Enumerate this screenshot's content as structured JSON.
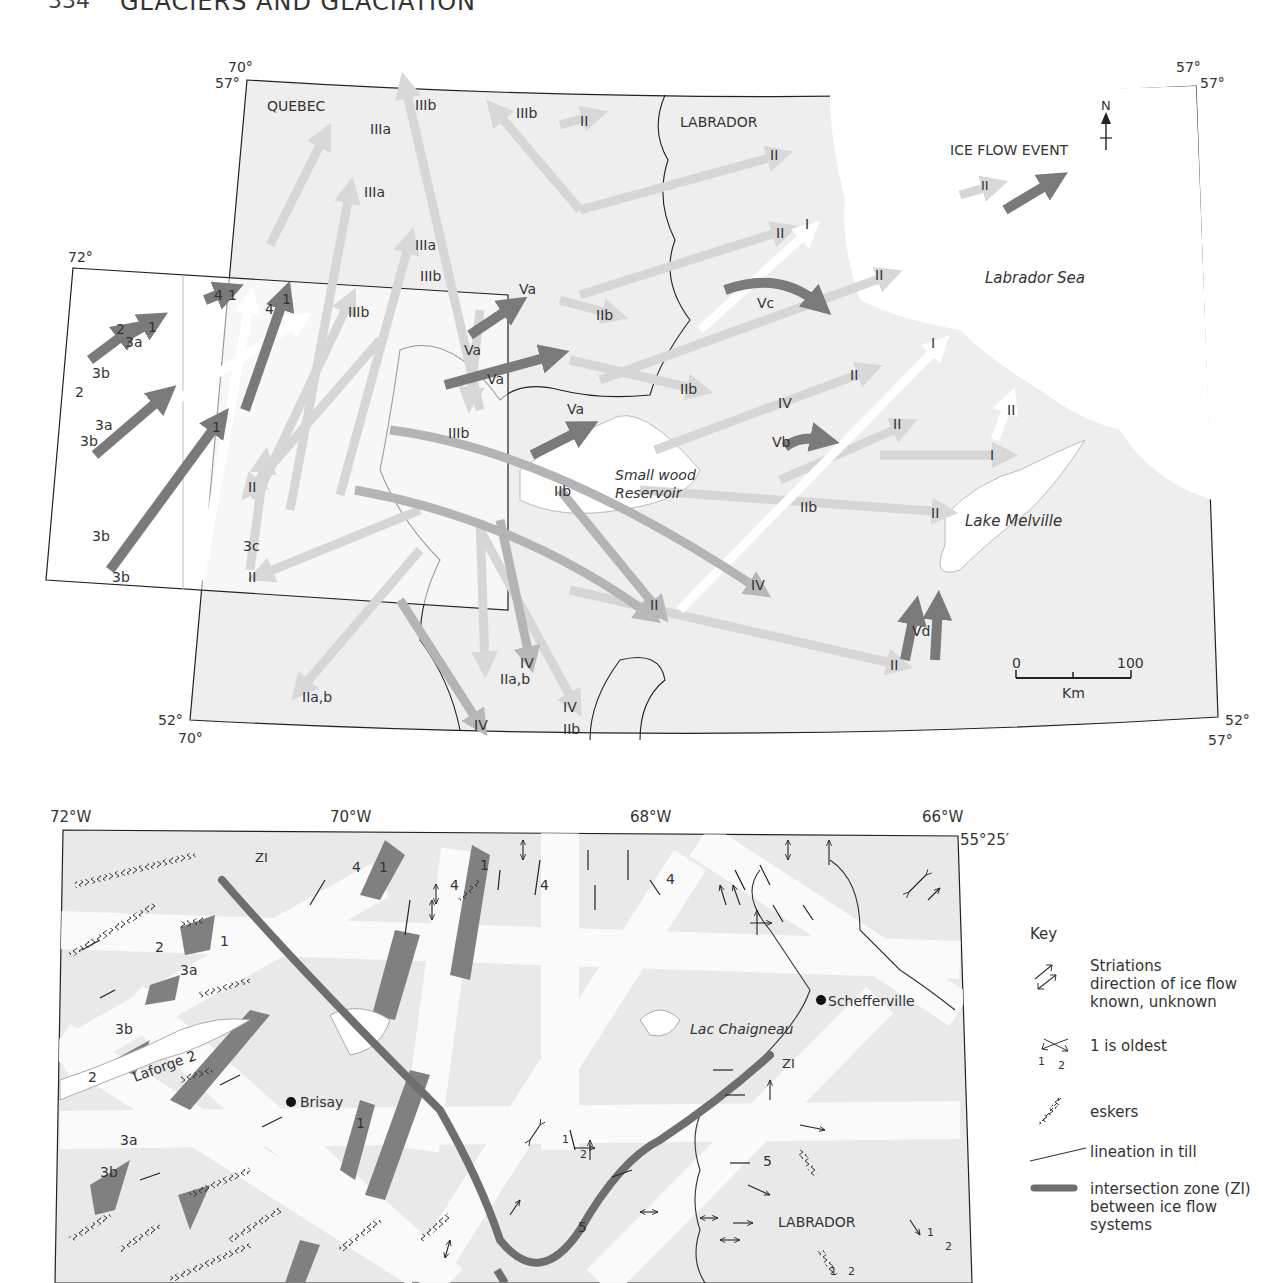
{
  "running_head": {
    "page_number": "334",
    "title": "GLACIERS AND GLACIATION"
  },
  "top_map": {
    "corners": {
      "top_left_lon": "70°",
      "top_left_lat": "57°",
      "top_right_lon": "57°",
      "top_right_lat": "57°",
      "bottom_left_lat": "52°",
      "bottom_left_lon": "70°",
      "bottom_right_lat": "52°",
      "bottom_right_lon": "57°",
      "inset_lon": "72°"
    },
    "regions": {
      "quebec": "QUEBEC",
      "labrador": "LABRADOR",
      "labrador_sea": "Labrador Sea",
      "smallwood_1": "Small wood",
      "smallwood_2": "Reservoir",
      "lake_melville": "Lake Melville"
    },
    "legend": {
      "title": "ICE FLOW EVENT",
      "sample_label": "II",
      "north": "N"
    },
    "scale": {
      "start": "0",
      "end": "100",
      "unit": "Km"
    },
    "flow_labels": [
      "IIIa",
      "IIIb",
      "IIIb",
      "II",
      "IIIa",
      "IIIa",
      "IIIb",
      "II",
      "II",
      "I",
      "II",
      "Va",
      "Va",
      "Va",
      "IIb",
      "Vc",
      "IIb",
      "II",
      "I",
      "IV",
      "Va",
      "IIIb",
      "II",
      "IIb",
      "Vb",
      "II",
      "I",
      "II",
      "IIb",
      "II",
      "IV",
      "IV",
      "Vd",
      "II",
      "IIa,b",
      "IIa,b",
      "IV",
      "IV",
      "IIb",
      "IIIb",
      "II",
      "3c",
      "II"
    ],
    "inset_labels": [
      "4",
      "1",
      "4",
      "1",
      "2",
      "1",
      "3a",
      "3b",
      "2",
      "3a",
      "3b",
      "1",
      "3b",
      "3b"
    ]
  },
  "bottom_map": {
    "lon_ticks": [
      "72°W",
      "70°W",
      "68°W",
      "66°W"
    ],
    "lat_tick": "55°25′",
    "places": {
      "brisay": "Brisay",
      "schefferville": "Schefferville",
      "laforge": "Laforge 2",
      "lac_chaigneau": "Lac Chaigneau",
      "labrador": "LABRADOR"
    },
    "zi_labels": [
      "ZI",
      "ZI"
    ],
    "flow_numbers": [
      "4",
      "1",
      "4",
      "1",
      "4",
      "4",
      "2",
      "1",
      "3a",
      "3b",
      "2",
      "1",
      "3a",
      "3b",
      "5",
      "5",
      "1",
      "2",
      "1",
      "2",
      "1",
      "2"
    ]
  },
  "key": {
    "title": "Key",
    "items": [
      {
        "label": "Striations\ndirection of ice flow\nknown, unknown",
        "icon": "striation-arrows-icon"
      },
      {
        "label": "1 is oldest",
        "icon": "crossing-striations-icon",
        "sub1": "1",
        "sub2": "2"
      },
      {
        "label": "eskers",
        "icon": "esker-icon"
      },
      {
        "label": "lineation in till",
        "icon": "lineation-icon"
      },
      {
        "label": "intersection zone (ZI)\nbetween ice flow\nsystems",
        "icon": "intersection-zone-icon"
      }
    ]
  },
  "colors": {
    "land": "#eeeeee",
    "water": "#ffffff",
    "dark_arrow": "#7a7a7a",
    "mid_arrow": "#b4b4b4",
    "light_arrow": "#d6d6d6",
    "zi_line": "#6e6e6e"
  }
}
